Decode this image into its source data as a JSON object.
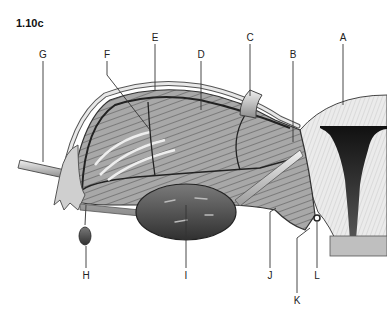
{
  "figure": {
    "number": "1.10c"
  },
  "labels": [
    {
      "id": "A",
      "text": "A",
      "x": 343,
      "y": 33
    },
    {
      "id": "B",
      "text": "B",
      "x": 293,
      "y": 50
    },
    {
      "id": "C",
      "text": "C",
      "x": 250,
      "y": 33
    },
    {
      "id": "D",
      "text": "D",
      "x": 201,
      "y": 50
    },
    {
      "id": "E",
      "text": "E",
      "x": 155,
      "y": 33
    },
    {
      "id": "F",
      "text": "F",
      "x": 107,
      "y": 50
    },
    {
      "id": "G",
      "text": "G",
      "x": 43,
      "y": 50
    },
    {
      "id": "H",
      "text": "H",
      "x": 86,
      "y": 271
    },
    {
      "id": "I",
      "text": "I",
      "x": 186,
      "y": 271
    },
    {
      "id": "J",
      "text": "J",
      "x": 270,
      "y": 271
    },
    {
      "id": "K",
      "text": "K",
      "x": 297,
      "y": 296
    },
    {
      "id": "L",
      "text": "L",
      "x": 317,
      "y": 271
    }
  ],
  "colors": {
    "line": "#333333",
    "text": "#222222",
    "dark_tissue": "#2a2a2a",
    "mid_tissue": "#8a8a8a",
    "light_tissue": "#d9d9d9"
  }
}
